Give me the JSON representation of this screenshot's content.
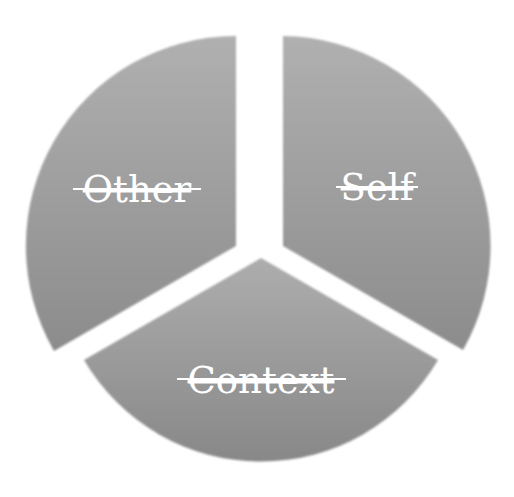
{
  "diagram": {
    "type": "exploded-pie-cycle",
    "segments": [
      {
        "id": "other",
        "label": "Other",
        "position": "upper-left",
        "color_top": "#adadad",
        "color_bottom": "#8e8e8e"
      },
      {
        "id": "self",
        "label": "Self",
        "position": "upper-right",
        "color_top": "#adadad",
        "color_bottom": "#8e8e8e"
      },
      {
        "id": "context",
        "label": "Context",
        "position": "bottom",
        "color_top": "#ababab",
        "color_bottom": "#8a8a8a"
      }
    ],
    "label_color": "#ffffff",
    "label_style": "strikethrough",
    "background": "#ffffff"
  }
}
